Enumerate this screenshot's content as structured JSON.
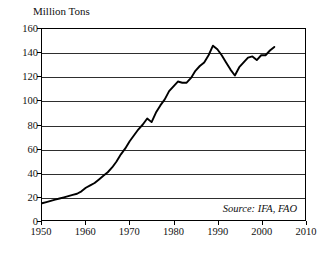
{
  "chart_data": {
    "type": "line",
    "title": "Million Tons",
    "xlabel": "",
    "ylabel": "Million Tons",
    "xlim": [
      1950,
      2010
    ],
    "ylim": [
      0,
      160
    ],
    "grid": true,
    "legend_position": "none",
    "annotation": "Source: IFA, FAO",
    "x_ticks": [
      1950,
      1960,
      1970,
      1980,
      1990,
      2000,
      2010
    ],
    "y_ticks": [
      0,
      20,
      40,
      60,
      80,
      100,
      120,
      140,
      160
    ],
    "series": [
      {
        "name": "World Fertilizer Consumption",
        "x": [
          1950,
          1951,
          1952,
          1953,
          1954,
          1955,
          1956,
          1957,
          1958,
          1959,
          1960,
          1961,
          1962,
          1963,
          1964,
          1965,
          1966,
          1967,
          1968,
          1969,
          1970,
          1971,
          1972,
          1973,
          1974,
          1975,
          1976,
          1977,
          1978,
          1979,
          1980,
          1981,
          1982,
          1983,
          1984,
          1985,
          1986,
          1987,
          1988,
          1989,
          1990,
          1991,
          1992,
          1993,
          1994,
          1995,
          1996,
          1997,
          1998,
          1999,
          2000,
          2001,
          2002,
          2003
        ],
        "values": [
          14,
          15,
          16,
          17,
          18,
          19,
          20,
          21,
          22,
          24,
          27,
          29,
          31,
          34,
          37,
          40,
          44,
          49,
          55,
          60,
          66,
          71,
          76,
          80,
          85,
          82,
          90,
          96,
          101,
          108,
          112,
          116,
          115,
          115,
          119,
          125,
          129,
          132,
          138,
          146,
          143,
          138,
          132,
          126,
          121,
          128,
          132,
          136,
          137,
          134,
          138,
          138,
          142,
          145
        ],
        "color": "#000000"
      }
    ]
  }
}
